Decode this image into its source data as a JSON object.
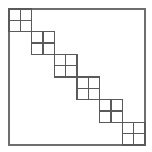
{
  "figure": {
    "type": "geometric-diagram",
    "canvas": {
      "width": 152,
      "height": 152,
      "background": "#ffffff"
    },
    "outer_square": {
      "name": "outer-square",
      "x": 9,
      "y": 9,
      "width": 136,
      "height": 136,
      "stroke": "#6e6e6e",
      "stroke_width": 1.1,
      "fill": "none"
    },
    "blocks": {
      "count": 6,
      "size": 22.667,
      "subdivision": "2x2",
      "stroke": "#5a5a5a",
      "stroke_width": 1.1,
      "fill": "none",
      "items": [
        {
          "index": 1,
          "x": 9.0,
          "y": 9.0,
          "size": 22.667
        },
        {
          "index": 2,
          "x": 31.667,
          "y": 31.667,
          "size": 22.667
        },
        {
          "index": 3,
          "x": 54.333,
          "y": 54.333,
          "size": 22.667
        },
        {
          "index": 4,
          "x": 77.0,
          "y": 77.0,
          "size": 22.667
        },
        {
          "index": 5,
          "x": 99.667,
          "y": 99.667,
          "size": 22.667
        },
        {
          "index": 6,
          "x": 122.333,
          "y": 122.333,
          "size": 22.667
        }
      ]
    }
  }
}
